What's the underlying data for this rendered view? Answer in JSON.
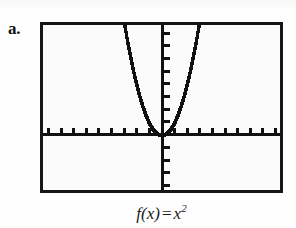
{
  "figure": {
    "item_label": "a.",
    "caption": {
      "func_name": "f",
      "open_paren": "(",
      "variable": "x",
      "close_paren": ")",
      "equals": "=",
      "base": "x",
      "exponent": "2",
      "full_text": "f(x) = x2"
    },
    "frame": {
      "border_color": "#161616",
      "background_color": "#fbfbfb",
      "x": 40,
      "y": 22,
      "width": 243,
      "height": 171
    }
  },
  "chart_data": {
    "type": "line",
    "title": "",
    "subtitle": "",
    "xlabel": "",
    "ylabel": "",
    "function": "f(x) = x^2",
    "expression": "x^2",
    "style": "graphing-calculator-pixelated",
    "grid": false,
    "legend": null,
    "legend_position": "none",
    "line_color": "#111111",
    "axis_color": "#111111",
    "xlim": [
      -9.4,
      9.4
    ],
    "ylim": [
      -4.4,
      8.6
    ],
    "xtick_step": 1,
    "ytick_step": 1,
    "xticks": [
      -9,
      -8,
      -7,
      -6,
      -5,
      -4,
      -3,
      -2,
      -1,
      1,
      2,
      3,
      4,
      5,
      6,
      7,
      8,
      9
    ],
    "yticks": [
      -4,
      -3,
      -2,
      -1,
      1,
      2,
      3,
      4,
      5,
      6,
      7,
      8
    ],
    "tick_labels_shown": false,
    "axis_origin": {
      "x": 0,
      "y": 0
    },
    "series": [
      {
        "name": "f(x) = x^2",
        "x": [
          -2.95,
          -2.8,
          -2.6,
          -2.4,
          -2.2,
          -2.0,
          -1.8,
          -1.6,
          -1.4,
          -1.2,
          -1.0,
          -0.8,
          -0.6,
          -0.4,
          -0.2,
          0.0,
          0.2,
          0.4,
          0.6,
          0.8,
          1.0,
          1.2,
          1.4,
          1.6,
          1.8,
          2.0,
          2.2,
          2.4,
          2.6,
          2.8,
          2.95
        ],
        "y": [
          8.7,
          7.84,
          6.76,
          5.76,
          4.84,
          4.0,
          3.24,
          2.56,
          1.96,
          1.44,
          1.0,
          0.64,
          0.36,
          0.16,
          0.04,
          0.0,
          0.04,
          0.16,
          0.36,
          0.64,
          1.0,
          1.44,
          1.96,
          2.56,
          3.24,
          4.0,
          4.84,
          5.76,
          6.76,
          7.84,
          8.7
        ]
      }
    ]
  }
}
